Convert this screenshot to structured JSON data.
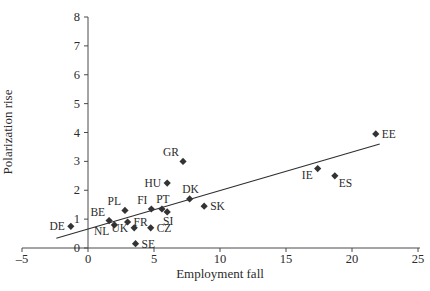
{
  "chart_data": {
    "type": "scatter",
    "title": "",
    "xlabel": "Employment fall",
    "ylabel": "Polarization rise",
    "xlim": [
      -5,
      25
    ],
    "ylim": [
      0,
      8
    ],
    "x_ticks": [
      -5,
      0,
      5,
      10,
      15,
      20,
      25
    ],
    "x_tick_labels": [
      "–5",
      "0",
      "5",
      "10",
      "15",
      "20",
      "25"
    ],
    "y_ticks": [
      0,
      1,
      2,
      3,
      4,
      5,
      6,
      7,
      8
    ],
    "y_tick_labels": [
      "0",
      "1",
      "2",
      "3",
      "4",
      "5",
      "6",
      "7",
      "8"
    ],
    "grid": false,
    "legend": "none",
    "marker": "diamond",
    "marker_color": "#333333",
    "trend_color": "#2e2e2e",
    "axis_color": "#4a4a4a",
    "text_color": "#2b2b2b",
    "points": [
      {
        "label": "DE",
        "x": -1.3,
        "y": 0.75,
        "label_pos": "left"
      },
      {
        "label": "BE",
        "x": 1.6,
        "y": 0.95,
        "label_pos": "above-left"
      },
      {
        "label": "NL",
        "x": 2.0,
        "y": 0.8,
        "label_pos": "below-left"
      },
      {
        "label": "PL",
        "x": 2.8,
        "y": 1.3,
        "label_pos": "above-left"
      },
      {
        "label": "FR",
        "x": 3.0,
        "y": 0.9,
        "label_pos": "right"
      },
      {
        "label": "UK",
        "x": 3.5,
        "y": 0.7,
        "label_pos": "left"
      },
      {
        "label": "SE",
        "x": 3.6,
        "y": 0.15,
        "label_pos": "right"
      },
      {
        "label": "CZ",
        "x": 4.75,
        "y": 0.7,
        "label_pos": "right"
      },
      {
        "label": "FI",
        "x": 4.8,
        "y": 1.35,
        "label_pos": "above-left"
      },
      {
        "label": "PT",
        "x": 5.6,
        "y": 1.35,
        "label_pos": "above"
      },
      {
        "label": "SI",
        "x": 6.0,
        "y": 1.25,
        "label_pos": "below"
      },
      {
        "label": "HU",
        "x": 6.0,
        "y": 2.25,
        "label_pos": "left"
      },
      {
        "label": "GR",
        "x": 7.2,
        "y": 3.0,
        "label_pos": "above-left"
      },
      {
        "label": "DK",
        "x": 7.7,
        "y": 1.7,
        "label_pos": "above"
      },
      {
        "label": "SK",
        "x": 8.8,
        "y": 1.45,
        "label_pos": "right"
      },
      {
        "label": "IE",
        "x": 17.4,
        "y": 2.75,
        "label_pos": "below-left"
      },
      {
        "label": "ES",
        "x": 18.7,
        "y": 2.5,
        "label_pos": "below-right"
      },
      {
        "label": "EE",
        "x": 21.8,
        "y": 3.95,
        "label_pos": "right"
      }
    ],
    "trendline": {
      "x1": -2.4,
      "y1": 0.34,
      "x2": 22.1,
      "y2": 3.6
    }
  }
}
